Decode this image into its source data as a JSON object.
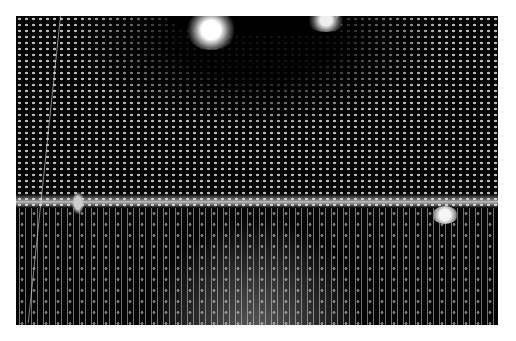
{
  "image": {
    "alt": "Black and white photograph of the interior of a large cylindrical detector tank lined with rows of spherical photomultiplier tubes, with lights at the top and a small boat on the water at right",
    "colors": {
      "background": "#ffffff",
      "photo_dark": "#050505",
      "highlight": "#ffffff"
    }
  }
}
